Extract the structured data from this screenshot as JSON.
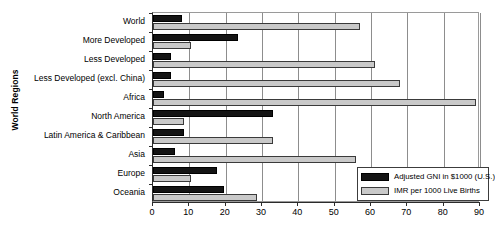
{
  "chart_data": {
    "type": "bar",
    "orientation": "horizontal",
    "title": "",
    "xlabel": "",
    "ylabel": "World Regions",
    "xlim": [
      0,
      90
    ],
    "xticks": [
      0,
      10,
      20,
      30,
      40,
      50,
      60,
      70,
      80,
      90
    ],
    "grid": true,
    "legend_position": "bottom-right",
    "categories": [
      "World",
      "More Developed",
      "Less Developed",
      "Less Developed (excl. China)",
      "Africa",
      "North America",
      "Latin America & Caribbean",
      "Asia",
      "Europe",
      "Oceania"
    ],
    "series": [
      {
        "name": "Adjusted GNI in $1000 (U.S.)",
        "color": "#141414",
        "values": [
          8,
          23.5,
          5,
          5,
          3,
          33,
          8.5,
          6,
          17.5,
          19.5
        ]
      },
      {
        "name": "IMR per 1000 Live Births",
        "color": "#c9c9c9",
        "values": [
          57,
          10.5,
          61,
          68,
          89,
          8.5,
          33,
          56,
          10.5,
          28.5
        ]
      }
    ]
  },
  "legend": {
    "items": [
      {
        "label": "Adjusted GNI in $1000 (U.S.)",
        "swatch": "gni"
      },
      {
        "label": "IMR per 1000 Live Births",
        "swatch": "imr"
      }
    ]
  },
  "colors": {
    "gni": "#141414",
    "imr": "#c9c9c9",
    "axis": "#2b2b2b",
    "grid": "#8d8d8d",
    "background": "#ffffff"
  }
}
